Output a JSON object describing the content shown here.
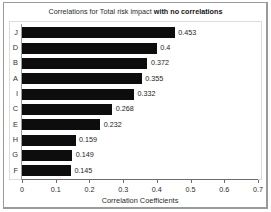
{
  "figure": {
    "background_color": "#ffffff",
    "frame_color": "#9a9a9a",
    "plot_border_color": "#dcdcdc",
    "bar_color": "#0d0d0d"
  },
  "title": {
    "regular": "Correlations for Total risk impact",
    "bold": "with no correlations"
  },
  "chart_data": {
    "type": "bar",
    "orientation": "horizontal",
    "xlabel": "Correlation Coefficients",
    "ylabel": "",
    "xlim": [
      0,
      0.7
    ],
    "xticks": [
      "0",
      "0.1",
      "0.2",
      "0.3",
      "0.4",
      "0.5",
      "0.6",
      "0.7"
    ],
    "xtick_values": [
      0,
      0.1,
      0.2,
      0.3,
      0.4,
      0.5,
      0.6,
      0.7
    ],
    "grid": false,
    "legend": null,
    "categories": [
      "J",
      "D",
      "B",
      "A",
      "I",
      "C",
      "E",
      "H",
      "G",
      "F"
    ],
    "values": [
      0.453,
      0.4,
      0.372,
      0.355,
      0.332,
      0.268,
      0.232,
      0.159,
      0.149,
      0.145
    ],
    "value_labels": [
      "0.453",
      "0.4",
      "0.372",
      "0.355",
      "0.332",
      "0.268",
      "0.232",
      "0.159",
      "0.149",
      "0.145"
    ],
    "series": [
      {
        "name": "Correlation Coefficients",
        "color": "#0d0d0d",
        "points": [
          {
            "category": "J",
            "value": 0.453,
            "label": "0.453"
          },
          {
            "category": "D",
            "value": 0.4,
            "label": "0.4"
          },
          {
            "category": "B",
            "value": 0.372,
            "label": "0.372"
          },
          {
            "category": "A",
            "value": 0.355,
            "label": "0.355"
          },
          {
            "category": "I",
            "value": 0.332,
            "label": "0.332"
          },
          {
            "category": "C",
            "value": 0.268,
            "label": "0.268"
          },
          {
            "category": "E",
            "value": 0.232,
            "label": "0.232"
          },
          {
            "category": "H",
            "value": 0.159,
            "label": "0.159"
          },
          {
            "category": "G",
            "value": 0.149,
            "label": "0.149"
          },
          {
            "category": "F",
            "value": 0.145,
            "label": "0.145"
          }
        ]
      }
    ]
  }
}
